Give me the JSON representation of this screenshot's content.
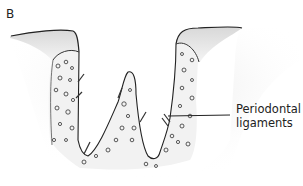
{
  "figure": {
    "panel_label": "B",
    "callout": {
      "line1": "Periodontal",
      "line2": "ligaments"
    }
  }
}
